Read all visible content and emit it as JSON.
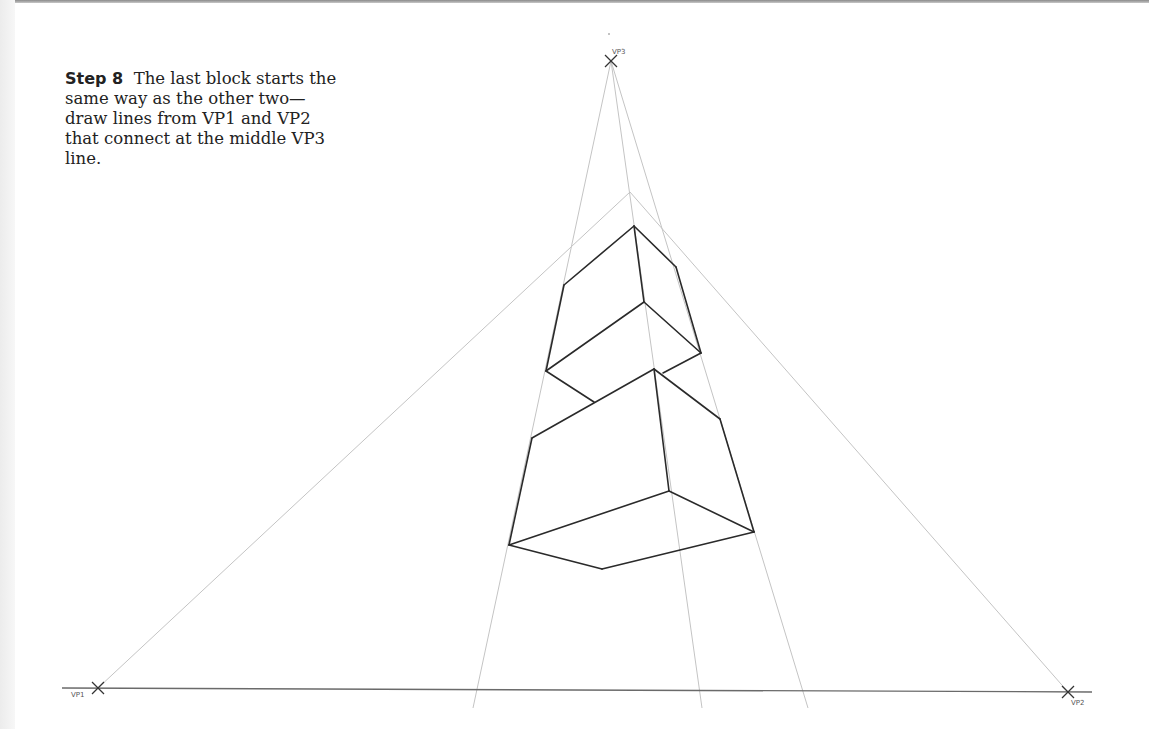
{
  "caption": {
    "step_label": "Step 8",
    "text": "The last block starts the same way as the other two—draw lines from VP1 and VP2 that connect at the middle VP3 line."
  },
  "vanishing_points": {
    "vp1": {
      "label": "VP1",
      "x": 98,
      "y": 688
    },
    "vp2": {
      "label": "VP2",
      "x": 1068,
      "y": 692
    },
    "vp3": {
      "label": "VP3",
      "x": 611,
      "y": 61
    }
  },
  "colors": {
    "guide_line": "#c4c4c4",
    "block_line": "#2a2a2a",
    "horizon_line": "#6a6a6a",
    "marker": "#333333",
    "text": "#222222"
  },
  "horizon": {
    "x1": 62,
    "y1": 688,
    "x2": 1092,
    "y2": 692
  },
  "guides": [
    {
      "id": "vp3-left",
      "x1": 611,
      "y1": 61,
      "x2": 473,
      "y2": 708
    },
    {
      "id": "vp3-center",
      "x1": 611,
      "y1": 61,
      "x2": 702,
      "y2": 708
    },
    {
      "id": "vp3-right",
      "x1": 611,
      "y1": 61,
      "x2": 808,
      "y2": 708
    },
    {
      "id": "vp1-to-apex",
      "x1": 98,
      "y1": 688,
      "x2": 630,
      "y2": 192
    },
    {
      "id": "vp2-to-apex",
      "x1": 1068,
      "y1": 692,
      "x2": 630,
      "y2": 192
    }
  ],
  "blocks": {
    "top_block": [
      [
        634,
        226,
        564,
        285
      ],
      [
        634,
        226,
        676,
        267
      ],
      [
        634,
        226,
        644,
        302
      ],
      [
        564,
        285,
        546,
        371
      ],
      [
        676,
        267,
        701,
        353
      ],
      [
        644,
        302,
        546,
        371
      ],
      [
        644,
        302,
        701,
        353
      ],
      [
        546,
        371,
        594,
        402
      ],
      [
        701,
        353,
        663,
        373
      ]
    ],
    "bottom_block": [
      [
        654,
        369,
        532,
        438
      ],
      [
        654,
        369,
        720,
        419
      ],
      [
        654,
        369,
        669,
        491
      ],
      [
        532,
        438,
        509,
        545
      ],
      [
        720,
        419,
        754,
        532
      ],
      [
        669,
        491,
        509,
        545
      ],
      [
        669,
        491,
        754,
        532
      ],
      [
        509,
        545,
        602,
        569
      ],
      [
        602,
        569,
        754,
        532
      ]
    ]
  }
}
